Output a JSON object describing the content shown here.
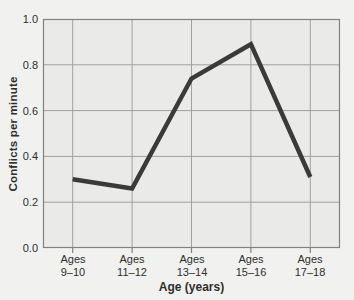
{
  "chart_data": {
    "type": "line",
    "title": "",
    "xlabel": "Age (years)",
    "ylabel": "Conflicts per minute",
    "categories": [
      {
        "line1": "Ages",
        "line2": "9–10"
      },
      {
        "line1": "Ages",
        "line2": "11–12"
      },
      {
        "line1": "Ages",
        "line2": "13–14"
      },
      {
        "line1": "Ages",
        "line2": "15–16"
      },
      {
        "line1": "Ages",
        "line2": "17–18"
      }
    ],
    "values": [
      0.3,
      0.26,
      0.74,
      0.89,
      0.31
    ],
    "y_ticks": [
      "1.0",
      "0.8",
      "0.6",
      "0.4",
      "0.2",
      "0.0"
    ],
    "ylim": [
      0,
      1.0
    ],
    "y_grid_step": 0.2,
    "grid": true,
    "legend": "none",
    "colors": {
      "line": "#3a3a3a",
      "grid": "#a0a09e",
      "border": "#82827f",
      "plot_bg": "#eaebe8",
      "page_bg": "#f1f2ef",
      "text": "#2e2e2e"
    }
  }
}
